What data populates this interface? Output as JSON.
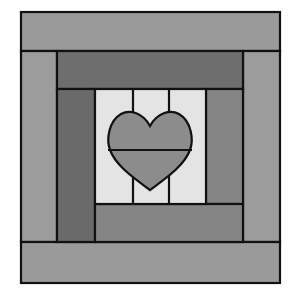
{
  "figure": {
    "colors": {
      "background": "#ffffff",
      "outline": "#111111",
      "outer_ring": "#9a9a9a",
      "inner_top": "#6e6e6e",
      "inner_left": "#6a6a6a",
      "inner_right": "#858585",
      "inner_bottom": "#858585",
      "center": "#e4e4e4",
      "heart": "#8c8c8c"
    },
    "pieces": [
      {
        "name": "outer-top-band"
      },
      {
        "name": "outer-left-strip"
      },
      {
        "name": "outer-right-strip"
      },
      {
        "name": "outer-bottom-band"
      },
      {
        "name": "inner-top-band"
      },
      {
        "name": "inner-left-strip"
      },
      {
        "name": "inner-right-strip"
      },
      {
        "name": "inner-bottom-band"
      },
      {
        "name": "center-square"
      },
      {
        "name": "heart-appliqué"
      }
    ]
  }
}
